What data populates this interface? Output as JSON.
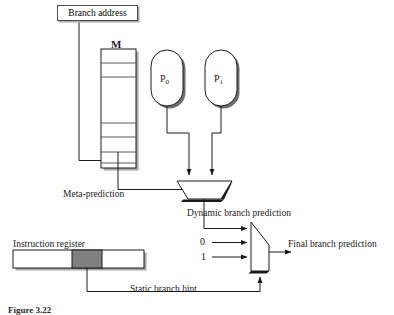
{
  "figure": {
    "domain": "diagram",
    "caption": "Figure 3.22"
  },
  "colors": {
    "line": "#1a1a1a",
    "shadow": "#a8a8a8",
    "box_border": "#4d4d4d",
    "shaded_field": "#808080",
    "background": "#ffffff"
  },
  "blocks": {
    "branch_address": {
      "label": "Branch address",
      "type": "input-box"
    },
    "meta_table": {
      "label": "M",
      "type": "memory-table",
      "rows": 7
    },
    "predictor_0": {
      "label": "P",
      "subscript": "0",
      "type": "predictor-capsule"
    },
    "predictor_1": {
      "label": "P",
      "subscript": "1",
      "type": "predictor-capsule"
    },
    "instruction_register": {
      "label": "Instruction register",
      "type": "register",
      "shaded_field": true
    },
    "mux_dynamic": {
      "type": "multiplexer",
      "orientation": "down",
      "inputs": 2,
      "select": "meta-prediction"
    },
    "mux_final": {
      "type": "multiplexer",
      "orientation": "right",
      "inputs": 3,
      "select": "static-branch-hint"
    }
  },
  "signals": {
    "meta_prediction": "Meta-prediction",
    "dynamic_branch_prediction": "Dynamic branch prediction",
    "final_branch_prediction": "Final branch prediction",
    "static_branch_hint": "Static branch hint",
    "mux_input_0": "0",
    "mux_input_1": "1"
  }
}
